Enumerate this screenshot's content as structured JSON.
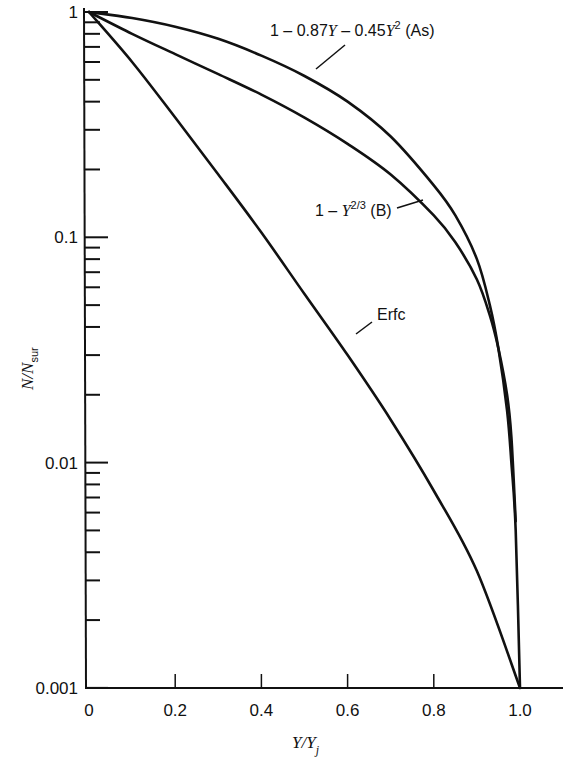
{
  "chart_data": {
    "type": "line",
    "title": "",
    "xlabel": "Y/Y_j",
    "ylabel": "N/N_sur",
    "xscale": "linear",
    "yscale": "log",
    "xlim": [
      0,
      1.1
    ],
    "ylim": [
      0.001,
      1
    ],
    "x_ticks": [
      "0",
      "0.2",
      "0.4",
      "0.6",
      "0.8",
      "1.0"
    ],
    "y_ticks": [
      "0.001",
      "0.01",
      "0.1",
      "1"
    ],
    "grid": false,
    "legend": "inline labels",
    "series": [
      {
        "name": "1 - 0.87Y - 0.45Y² (As)",
        "x": [
          0,
          0.1,
          0.2,
          0.3,
          0.4,
          0.5,
          0.6,
          0.7,
          0.8,
          0.85,
          0.9,
          0.93,
          0.95,
          0.97,
          0.98,
          0.99,
          1.0
        ],
        "y": [
          1,
          0.94,
          0.86,
          0.76,
          0.64,
          0.52,
          0.4,
          0.28,
          0.17,
          0.125,
          0.08,
          0.05,
          0.032,
          0.017,
          0.01,
          0.005,
          0.001
        ]
      },
      {
        "name": "1 - Y^(2/3) (B)",
        "x": [
          0,
          0.1,
          0.2,
          0.3,
          0.4,
          0.5,
          0.6,
          0.7,
          0.8,
          0.85,
          0.9,
          0.93,
          0.95,
          0.97,
          0.98,
          0.99
        ],
        "y": [
          1,
          0.8,
          0.65,
          0.53,
          0.43,
          0.34,
          0.26,
          0.19,
          0.125,
          0.095,
          0.065,
          0.045,
          0.032,
          0.02,
          0.013,
          0.0055
        ]
      },
      {
        "name": "Erfc",
        "x": [
          0,
          0.1,
          0.2,
          0.3,
          0.4,
          0.5,
          0.6,
          0.7,
          0.8,
          0.9,
          1.0
        ],
        "y": [
          1,
          0.6,
          0.34,
          0.19,
          0.105,
          0.056,
          0.03,
          0.0155,
          0.0075,
          0.0033,
          0.001
        ]
      }
    ],
    "annotations": [
      {
        "text": "1 - 0.87Y - 0.45Y² (As)",
        "target_series": 0
      },
      {
        "text": "1 - Y^(2/3) (B)",
        "target_series": 1
      },
      {
        "text": "Erfc",
        "target_series": 2
      }
    ]
  },
  "labels": {
    "as_prefix": "1 – 0.87",
    "as_mid": " – 0.45",
    "as_sup": "2",
    "as_suffix": " (As)",
    "b_prefix": "1 – ",
    "b_sup": "2/3",
    "b_suffix": " (B)",
    "erfc": "Erfc",
    "var_y": "Y",
    "xlabel_main": "Y/Y",
    "xlabel_sub": "j",
    "ylabel_main": "N/N",
    "ylabel_sub": "sur"
  }
}
